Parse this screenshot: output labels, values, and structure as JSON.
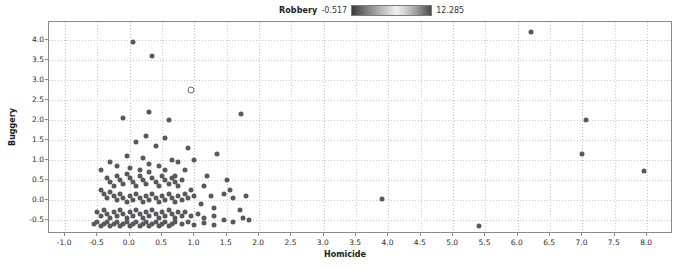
{
  "legend": {
    "title": "Robbery",
    "min_label": "-0.517",
    "max_label": "12.285",
    "gradient_icon": "color-gradient-bar"
  },
  "axes": {
    "xlabel": "Homicide",
    "ylabel": "Buggery",
    "xticks": [
      "-1.0",
      "-0.5",
      "0.0",
      "0.5",
      "1.0",
      "1.5",
      "2.0",
      "2.5",
      "3.0",
      "3.5",
      "4.0",
      "4.5",
      "5.0",
      "5.5",
      "6.0",
      "6.5",
      "7.0",
      "7.5",
      "8.0"
    ],
    "yticks": [
      "-0.5",
      "0.0",
      "0.5",
      "1.0",
      "1.5",
      "2.0",
      "2.5",
      "3.0",
      "3.5",
      "4.0"
    ]
  },
  "chart_data": {
    "type": "scatter",
    "title": "",
    "xlabel": "Homicide",
    "ylabel": "Buggery",
    "xlim": [
      -1.25,
      8.4
    ],
    "ylim": [
      -0.85,
      4.45
    ],
    "grid": true,
    "legend_position": "top-center",
    "colorbar": {
      "label": "Robbery",
      "min": -0.517,
      "max": 12.285
    },
    "marker_color": "#59595c",
    "highlight_marker_color": "#ffffff",
    "series": [
      {
        "name": "points",
        "points": [
          [
            0.05,
            3.95
          ],
          [
            0.35,
            3.6
          ],
          [
            0.95,
            2.75
          ],
          [
            6.2,
            4.2
          ],
          [
            0.3,
            2.2
          ],
          [
            0.6,
            2.0
          ],
          [
            1.72,
            2.15
          ],
          [
            7.05,
            2.0
          ],
          [
            -0.1,
            2.05
          ],
          [
            0.25,
            1.6
          ],
          [
            0.55,
            1.55
          ],
          [
            0.9,
            1.3
          ],
          [
            7.0,
            1.15
          ],
          [
            0.1,
            1.45
          ],
          [
            0.4,
            1.35
          ],
          [
            0.65,
            1.0
          ],
          [
            0.2,
            1.05
          ],
          [
            -0.05,
            1.1
          ],
          [
            0.75,
            0.95
          ],
          [
            1.0,
            1.0
          ],
          [
            7.95,
            0.72
          ],
          [
            3.9,
            0.02
          ],
          [
            5.4,
            -0.65
          ],
          [
            -0.35,
            0.55
          ],
          [
            -0.3,
            0.45
          ],
          [
            -0.25,
            0.35
          ],
          [
            -0.2,
            0.6
          ],
          [
            -0.15,
            0.5
          ],
          [
            -0.1,
            0.4
          ],
          [
            -0.05,
            0.65
          ],
          [
            0.0,
            0.55
          ],
          [
            0.05,
            0.45
          ],
          [
            0.1,
            0.35
          ],
          [
            0.15,
            0.6
          ],
          [
            0.2,
            0.5
          ],
          [
            0.25,
            0.4
          ],
          [
            0.3,
            0.7
          ],
          [
            0.35,
            0.55
          ],
          [
            0.4,
            0.45
          ],
          [
            0.45,
            0.35
          ],
          [
            0.5,
            0.6
          ],
          [
            0.55,
            0.5
          ],
          [
            0.6,
            0.4
          ],
          [
            0.65,
            0.55
          ],
          [
            0.7,
            0.45
          ],
          [
            0.75,
            0.35
          ],
          [
            0.8,
            0.5
          ],
          [
            -0.45,
            0.25
          ],
          [
            -0.4,
            0.15
          ],
          [
            -0.35,
            0.05
          ],
          [
            -0.3,
            0.2
          ],
          [
            -0.25,
            0.1
          ],
          [
            -0.2,
            0.0
          ],
          [
            -0.15,
            0.15
          ],
          [
            -0.1,
            0.05
          ],
          [
            -0.05,
            -0.05
          ],
          [
            0.0,
            0.1
          ],
          [
            0.05,
            0.0
          ],
          [
            0.1,
            0.15
          ],
          [
            0.15,
            0.05
          ],
          [
            0.2,
            -0.05
          ],
          [
            0.25,
            0.1
          ],
          [
            0.3,
            0.0
          ],
          [
            0.35,
            0.15
          ],
          [
            0.4,
            0.05
          ],
          [
            0.45,
            -0.05
          ],
          [
            0.5,
            0.1
          ],
          [
            0.55,
            0.0
          ],
          [
            0.6,
            0.15
          ],
          [
            0.65,
            0.05
          ],
          [
            0.7,
            -0.05
          ],
          [
            0.75,
            0.1
          ],
          [
            0.8,
            0.0
          ],
          [
            0.9,
            0.05
          ],
          [
            1.0,
            0.1
          ],
          [
            1.1,
            -0.1
          ],
          [
            1.25,
            0.1
          ],
          [
            1.45,
            0.15
          ],
          [
            1.6,
            0.05
          ],
          [
            -0.5,
            -0.3
          ],
          [
            -0.45,
            -0.4
          ],
          [
            -0.4,
            -0.25
          ],
          [
            -0.35,
            -0.35
          ],
          [
            -0.3,
            -0.45
          ],
          [
            -0.25,
            -0.3
          ],
          [
            -0.2,
            -0.4
          ],
          [
            -0.15,
            -0.25
          ],
          [
            -0.1,
            -0.35
          ],
          [
            -0.05,
            -0.45
          ],
          [
            0.0,
            -0.3
          ],
          [
            0.05,
            -0.4
          ],
          [
            0.1,
            -0.25
          ],
          [
            0.15,
            -0.35
          ],
          [
            0.2,
            -0.45
          ],
          [
            0.25,
            -0.3
          ],
          [
            0.3,
            -0.4
          ],
          [
            0.35,
            -0.25
          ],
          [
            0.4,
            -0.35
          ],
          [
            0.45,
            -0.45
          ],
          [
            0.5,
            -0.3
          ],
          [
            0.55,
            -0.4
          ],
          [
            0.6,
            -0.25
          ],
          [
            0.65,
            -0.35
          ],
          [
            0.7,
            -0.45
          ],
          [
            0.75,
            -0.3
          ],
          [
            0.8,
            -0.4
          ],
          [
            0.85,
            -0.3
          ],
          [
            0.95,
            -0.4
          ],
          [
            1.05,
            -0.35
          ],
          [
            1.15,
            -0.45
          ],
          [
            1.3,
            -0.4
          ],
          [
            1.45,
            -0.5
          ],
          [
            1.6,
            -0.55
          ],
          [
            1.75,
            -0.45
          ],
          [
            1.85,
            -0.5
          ],
          [
            -0.55,
            -0.6
          ],
          [
            -0.5,
            -0.55
          ],
          [
            -0.45,
            -0.65
          ],
          [
            -0.4,
            -0.6
          ],
          [
            -0.35,
            -0.55
          ],
          [
            -0.3,
            -0.65
          ],
          [
            -0.25,
            -0.6
          ],
          [
            -0.2,
            -0.55
          ],
          [
            -0.15,
            -0.65
          ],
          [
            -0.1,
            -0.6
          ],
          [
            -0.05,
            -0.55
          ],
          [
            0.0,
            -0.65
          ],
          [
            0.05,
            -0.6
          ],
          [
            0.1,
            -0.55
          ],
          [
            0.15,
            -0.65
          ],
          [
            0.2,
            -0.6
          ],
          [
            0.25,
            -0.55
          ],
          [
            0.3,
            -0.65
          ],
          [
            0.35,
            -0.6
          ],
          [
            0.4,
            -0.55
          ],
          [
            0.45,
            -0.65
          ],
          [
            0.5,
            -0.6
          ],
          [
            0.55,
            -0.55
          ],
          [
            0.6,
            -0.65
          ],
          [
            0.65,
            -0.6
          ],
          [
            0.7,
            -0.55
          ],
          [
            0.8,
            -0.6
          ],
          [
            0.9,
            -0.55
          ],
          [
            1.0,
            -0.62
          ],
          [
            1.15,
            -0.58
          ],
          [
            1.3,
            -0.62
          ],
          [
            -0.2,
            0.85
          ],
          [
            0.0,
            0.8
          ],
          [
            0.45,
            0.85
          ],
          [
            0.85,
            0.75
          ],
          [
            1.35,
            1.15
          ],
          [
            1.2,
            0.6
          ],
          [
            1.5,
            0.5
          ],
          [
            1.15,
            0.35
          ],
          [
            1.55,
            0.25
          ],
          [
            1.8,
            0.1
          ],
          [
            1.3,
            -0.2
          ],
          [
            1.7,
            -0.25
          ],
          [
            0.95,
            0.25
          ],
          [
            0.85,
            0.15
          ],
          [
            -0.45,
            0.75
          ],
          [
            -0.3,
            0.95
          ],
          [
            0.15,
            0.75
          ],
          [
            0.55,
            0.75
          ],
          [
            0.7,
            0.6
          ],
          [
            0.3,
            0.9
          ]
        ]
      }
    ],
    "highlighted_point": [
      0.95,
      2.75
    ]
  }
}
